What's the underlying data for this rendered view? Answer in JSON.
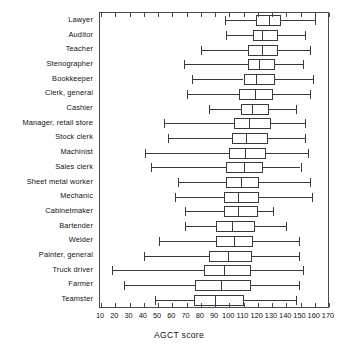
{
  "chart_data": {
    "type": "boxplot",
    "title": "",
    "xlabel": "AGCT score",
    "ylabel": "",
    "xlim": [
      10,
      170
    ],
    "xticks": [
      10,
      20,
      30,
      40,
      50,
      60,
      70,
      80,
      90,
      100,
      110,
      120,
      130,
      140,
      150,
      160,
      170
    ],
    "xticklabels": [
      "10",
      "20",
      "30",
      "40",
      "50",
      "60",
      "70",
      "80",
      "90",
      "100",
      "110",
      "120",
      "130",
      "140",
      "150",
      "160",
      "170"
    ],
    "grid": false,
    "legend": null,
    "orientation": "horizontal",
    "categories": [
      "Lawyer",
      "Auditor",
      "Teacher",
      "Stenographer",
      "Bookkeeper",
      "Clerk, general",
      "Cashier",
      "Manager, retail store",
      "Stock clerk",
      "Machinist",
      "Sales clerk",
      "Sheet metal worker",
      "Mechanic",
      "Cabinetmaker",
      "Bartender",
      "Welder",
      "Painter, general",
      "Truck driver",
      "Farmer",
      "Teamster"
    ],
    "boxes": [
      {
        "category": "Lawyer",
        "whisker_low": 97,
        "q1": 119,
        "median": 128,
        "q3": 136,
        "whisker_high": 160
      },
      {
        "category": "Auditor",
        "whisker_low": 98,
        "q1": 117,
        "median": 123,
        "q3": 134,
        "whisker_high": 153
      },
      {
        "category": "Teacher",
        "whisker_low": 80,
        "q1": 113,
        "median": 123,
        "q3": 134,
        "whisker_high": 157
      },
      {
        "category": "Stenographer",
        "whisker_low": 68,
        "q1": 113,
        "median": 121,
        "q3": 132,
        "whisker_high": 152
      },
      {
        "category": "Bookkeeper",
        "whisker_low": 74,
        "q1": 110,
        "median": 119,
        "q3": 132,
        "whisker_high": 159
      },
      {
        "category": "Clerk, general",
        "whisker_low": 70,
        "q1": 107,
        "median": 118,
        "q3": 131,
        "whisker_high": 157
      },
      {
        "category": "Cashier",
        "whisker_low": 86,
        "q1": 108,
        "median": 116,
        "q3": 128,
        "whisker_high": 147
      },
      {
        "category": "Manager, retail store",
        "whisker_low": 54,
        "q1": 103,
        "median": 114,
        "q3": 129,
        "whisker_high": 153
      },
      {
        "category": "Stock clerk",
        "whisker_low": 57,
        "q1": 102,
        "median": 112,
        "q3": 127,
        "whisker_high": 153
      },
      {
        "category": "Machinist",
        "whisker_low": 41,
        "q1": 100,
        "median": 111,
        "q3": 126,
        "whisker_high": 155
      },
      {
        "category": "Sales clerk",
        "whisker_low": 45,
        "q1": 98,
        "median": 110,
        "q3": 124,
        "whisker_high": 150
      },
      {
        "category": "Sheet metal worker",
        "whisker_low": 64,
        "q1": 98,
        "median": 108,
        "q3": 121,
        "whisker_high": 157
      },
      {
        "category": "Mechanic",
        "whisker_low": 62,
        "q1": 96,
        "median": 106,
        "q3": 121,
        "whisker_high": 158
      },
      {
        "category": "Cabinetmaker",
        "whisker_low": 69,
        "q1": 96,
        "median": 106,
        "q3": 120,
        "whisker_high": 131
      },
      {
        "category": "Bartender",
        "whisker_low": 69,
        "q1": 91,
        "median": 102,
        "q3": 118,
        "whisker_high": 140
      },
      {
        "category": "Welder",
        "whisker_low": 51,
        "q1": 91,
        "median": 103,
        "q3": 117,
        "whisker_high": 149
      },
      {
        "category": "Painter, general",
        "whisker_low": 40,
        "q1": 86,
        "median": 99,
        "q3": 116,
        "whisker_high": 149
      },
      {
        "category": "Truck driver",
        "whisker_low": 18,
        "q1": 82,
        "median": 96,
        "q3": 115,
        "whisker_high": 152
      },
      {
        "category": "Farmer",
        "whisker_low": 26,
        "q1": 76,
        "median": 94,
        "q3": 115,
        "whisker_high": 149
      },
      {
        "category": "Teamster",
        "whisker_low": 48,
        "q1": 75,
        "median": 90,
        "q3": 110,
        "whisker_high": 147
      }
    ]
  }
}
